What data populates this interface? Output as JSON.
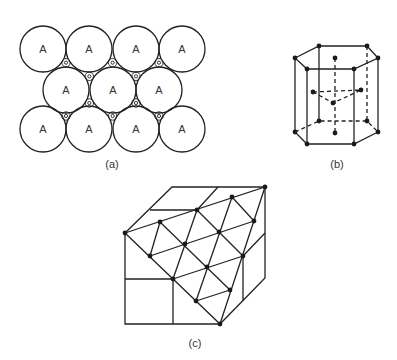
{
  "figure": {
    "panel_a": {
      "label": "(a)",
      "description": "Close-packed layer of spheres",
      "sphere_label": "A",
      "rows": [
        {
          "cy": 49,
          "cx": [
            43,
            89,
            136,
            182
          ],
          "labels": [
            "A",
            "A",
            "A",
            "A"
          ]
        },
        {
          "cy": 90,
          "cx": [
            66,
            113,
            159
          ],
          "labels": [
            "A",
            "A",
            "A"
          ]
        },
        {
          "cy": 129,
          "cx": [
            43,
            89,
            136,
            182
          ],
          "labels": [
            "A",
            "A",
            "A",
            "A"
          ]
        }
      ],
      "radius": 23
    },
    "panel_b": {
      "label": "(b)",
      "description": "Hexagonal close-packed unit cell"
    },
    "panel_c": {
      "label": "(c)",
      "description": "Cubic cell with (111) close-packed plane"
    }
  }
}
